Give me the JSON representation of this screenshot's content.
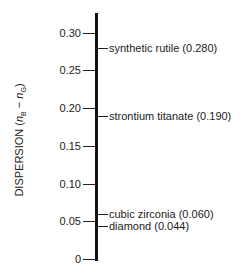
{
  "chart_data": {
    "type": "scale",
    "title": "",
    "ylabel": "DISPERSION (nB − nG)",
    "ylabel_parts": {
      "prefix": "DISPERSION (",
      "n1": "n",
      "sub1": "B",
      "minus": " − ",
      "n2": "n",
      "sub2": "G",
      "suffix": ")"
    },
    "ylim": [
      0,
      0.32
    ],
    "ticks": [
      {
        "value": 0.3,
        "label": "0.30"
      },
      {
        "value": 0.25,
        "label": "0.25"
      },
      {
        "value": 0.2,
        "label": "0.20"
      },
      {
        "value": 0.15,
        "label": "0.15"
      },
      {
        "value": 0.1,
        "label": "0.10"
      },
      {
        "value": 0.05,
        "label": "0.05"
      },
      {
        "value": 0,
        "label": "0"
      }
    ],
    "points": [
      {
        "name": "synthetic rutile",
        "value": 0.28,
        "label": "synthetic rutile (0.280)"
      },
      {
        "name": "strontium titanate",
        "value": 0.19,
        "label": "strontium titanate (0.190)"
      },
      {
        "name": "cubic zirconia",
        "value": 0.06,
        "label": "cubic zirconia (0.060)"
      },
      {
        "name": "diamond",
        "value": 0.044,
        "label": "diamond (0.044)"
      }
    ],
    "grid": false
  }
}
